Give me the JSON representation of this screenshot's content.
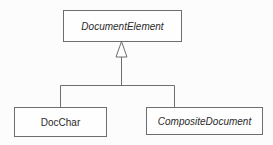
{
  "diagram": {
    "type": "UML class inheritance",
    "parent_class": {
      "label": "DocumentElement",
      "abstract": true
    },
    "child_classes": [
      {
        "label": "DocChar",
        "abstract": false
      },
      {
        "label": "CompositeDocument",
        "abstract": true
      }
    ],
    "relationship": "generalization",
    "colors": {
      "line": "#6e6e6e",
      "text": "#2a2a2a",
      "background": "#fcfcfc"
    }
  }
}
